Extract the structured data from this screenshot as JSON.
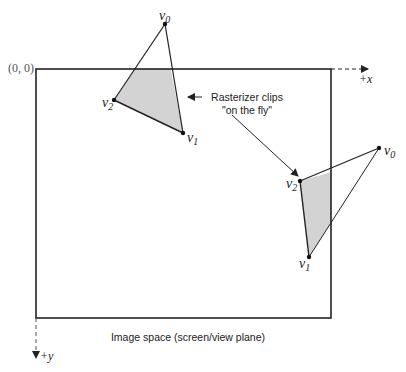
{
  "diagram": {
    "type": "clipping-illustration",
    "colors": {
      "stroke": "#222222",
      "fill_clipped": "#d3d3d3",
      "background": "#ffffff"
    },
    "image_space": {
      "caption": "Image space (screen/view plane)",
      "origin_label": "(0, 0)",
      "x_axis_label": "+x",
      "y_axis_label": "+y",
      "rect": {
        "left": 36,
        "top": 69,
        "right": 331,
        "bottom": 318
      }
    },
    "annotation": {
      "line1": "Rasterizer clips",
      "line2": "\"on the fly\""
    },
    "triangles": [
      {
        "name": "triangle-top",
        "vertices": [
          {
            "label": "v",
            "sub": "0",
            "x": 165,
            "y": 24
          },
          {
            "label": "v",
            "sub": "1",
            "x": 183,
            "y": 133
          },
          {
            "label": "v",
            "sub": "2",
            "x": 114,
            "y": 100
          }
        ],
        "clipped_edge": "top"
      },
      {
        "name": "triangle-right",
        "vertices": [
          {
            "label": "v",
            "sub": "0",
            "x": 379,
            "y": 148
          },
          {
            "label": "v",
            "sub": "1",
            "x": 309,
            "y": 257
          },
          {
            "label": "v",
            "sub": "2",
            "x": 300,
            "y": 181
          }
        ],
        "clipped_edge": "right"
      }
    ]
  }
}
